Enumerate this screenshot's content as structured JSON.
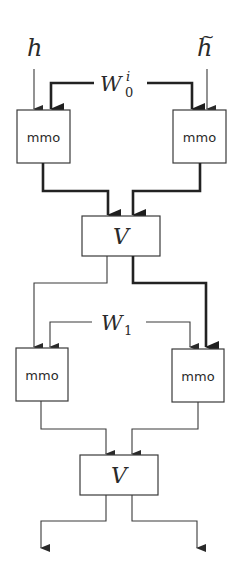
{
  "diagram": {
    "inputs": {
      "left": {
        "symbol": "h"
      },
      "right": {
        "symbol": "h",
        "accent": "~"
      }
    },
    "weights": {
      "w0": {
        "base": "W",
        "subscript": "0",
        "superscript": "i"
      },
      "w1": {
        "base": "W",
        "subscript": "1"
      }
    },
    "layer1": {
      "left_box": "mmo",
      "right_box": "mmo",
      "merge_box": "V"
    },
    "layer2": {
      "left_box": "mmo",
      "right_box": "mmo",
      "merge_box": "V"
    },
    "colors": {
      "stroke": "#3a3a3a",
      "thick_stroke": "#222222",
      "background": "#ffffff"
    }
  }
}
